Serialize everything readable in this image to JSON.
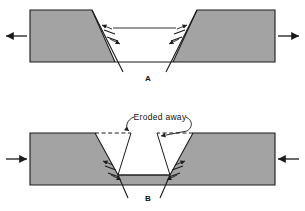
{
  "figure": {
    "background_color": "#ffffff",
    "rock_fill_color": "#a3a3a3",
    "line_color": "#1a1a1a",
    "width": 305,
    "height": 211
  },
  "panels": [
    {
      "id": "A",
      "label": "A",
      "label_x": 148,
      "label_y": 80,
      "description": "Graben with down-dropped central block bounded by two normal faults",
      "stress": "extension",
      "block_outline_points": "30,10 92,10 115,62 173,62 197,10 275,10 275,62 30,62",
      "surface_top_y": 10,
      "surface_bottom_y": 62,
      "block_left_x": 30,
      "block_right_x": 275,
      "graben_floor_y": 28,
      "graben_floor_left_x": 105,
      "graben_floor_right_x": 183,
      "faults": [
        {
          "name": "left-normal-fault",
          "x1": 92,
          "y1": 10,
          "x2": 123,
          "y2": 72,
          "dip_direction": "right",
          "slip_ticks": [
            {
              "x1": 105,
              "y1": 32,
              "x2": 116,
              "y2": 36
            },
            {
              "x1": 108,
              "y1": 38,
              "x2": 119,
              "y2": 42
            }
          ],
          "slip_arrows": [
            {
              "x1": 113,
              "y1": 30,
              "x2": 104,
              "y2": 27,
              "head": "up-left"
            },
            {
              "x1": 110,
              "y1": 40,
              "x2": 119,
              "y2": 43,
              "head": "down-right"
            }
          ]
        },
        {
          "name": "right-normal-fault",
          "x1": 197,
          "y1": 10,
          "x2": 166,
          "y2": 72,
          "dip_direction": "left",
          "slip_ticks": [
            {
              "x1": 173,
              "y1": 36,
              "x2": 184,
              "y2": 32
            },
            {
              "x1": 170,
              "y1": 42,
              "x2": 181,
              "y2": 38
            }
          ],
          "slip_arrows": [
            {
              "x1": 176,
              "y1": 30,
              "x2": 185,
              "y2": 27,
              "head": "up-right"
            },
            {
              "x1": 179,
              "y1": 40,
              "x2": 170,
              "y2": 43,
              "head": "down-left"
            }
          ]
        }
      ],
      "arrows": [
        {
          "name": "left-extension-arrow",
          "x1": 27,
          "y1": 36,
          "x2": 5,
          "y2": 36,
          "direction": "left"
        },
        {
          "name": "right-extension-arrow",
          "x1": 278,
          "y1": 36,
          "x2": 300,
          "y2": 36,
          "direction": "right"
        }
      ]
    },
    {
      "id": "B",
      "label": "B",
      "label_x": 148,
      "label_y": 200,
      "description": "Same graben after the upthrown shoulders have been eroded away",
      "stress": "compression",
      "block_outline_points": "30,133 95,133 118,175 170,175 193,133 275,133 275,185 30,185",
      "surface_top_y": 133,
      "surface_bottom_y": 185,
      "block_left_x": 30,
      "block_right_x": 275,
      "graben_floor_y": 175,
      "graben_floor_left_x": 118,
      "graben_floor_right_x": 170,
      "eroded_label": "Eroded away",
      "eroded_label_x": 150,
      "eroded_label_y": 121,
      "eroded_dashed": [
        {
          "name": "left-eroded-dash",
          "points": "95,133 131,133 118,175"
        },
        {
          "name": "right-eroded-dash",
          "points": "193,133 157,133 170,175"
        }
      ],
      "leaders": [
        {
          "name": "left-leader",
          "path": "M 133 119 C 126 122 126 128 129 132",
          "arrow_to": {
            "x": 130,
            "y": 134
          }
        },
        {
          "name": "right-leader",
          "path": "M 184 119 C 191 124 192 128 190 133",
          "arrow_to": {
            "x": 165,
            "y": 136
          }
        }
      ],
      "faults": [
        {
          "name": "left-normal-fault",
          "x1": 112,
          "y1": 161,
          "x2": 126,
          "y2": 195,
          "dip_direction": "right",
          "slip_ticks": [
            {
              "x1": 107,
              "y1": 168,
              "x2": 118,
              "y2": 172
            },
            {
              "x1": 110,
              "y1": 174,
              "x2": 121,
              "y2": 178
            }
          ],
          "slip_arrows": [
            {
              "x1": 114,
              "y1": 166,
              "x2": 106,
              "y2": 161,
              "head": "up-left"
            },
            {
              "x1": 113,
              "y1": 176,
              "x2": 121,
              "y2": 182,
              "head": "down-right"
            }
          ]
        },
        {
          "name": "right-normal-fault",
          "x1": 176,
          "y1": 161,
          "x2": 162,
          "y2": 195,
          "dip_direction": "left",
          "slip_ticks": [
            {
              "x1": 170,
              "y1": 172,
              "x2": 181,
              "y2": 168
            },
            {
              "x1": 167,
              "y1": 178,
              "x2": 178,
              "y2": 174
            }
          ],
          "slip_arrows": [
            {
              "x1": 174,
              "y1": 166,
              "x2": 182,
              "y2": 161,
              "head": "up-right"
            },
            {
              "x1": 175,
              "y1": 176,
              "x2": 167,
              "y2": 182,
              "head": "down-left"
            }
          ]
        }
      ],
      "arrows": [
        {
          "name": "left-compression-arrow",
          "x1": 5,
          "y1": 159,
          "x2": 27,
          "y2": 159,
          "direction": "right"
        },
        {
          "name": "right-compression-arrow",
          "x1": 300,
          "y1": 159,
          "x2": 278,
          "y2": 159,
          "direction": "left"
        }
      ]
    }
  ]
}
